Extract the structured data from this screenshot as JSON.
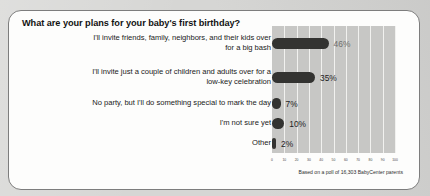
{
  "card": {
    "title": "What are your plans for your baby's first birthday?",
    "footnote": "Based on a poll of 16,303 BabyCenter parents"
  },
  "chart_data": {
    "type": "bar",
    "orientation": "horizontal",
    "title": "What are your plans for your baby's first birthday?",
    "xlabel": "",
    "ylabel": "",
    "xlim": [
      0,
      100
    ],
    "grid": true,
    "legend": false,
    "categories": [
      "I'll invite friends, family, neighbors, and their kids over for a big bash",
      "I'll invite just a couple of children and adults over for a low-key celebration",
      "No party, but I'll do something special to mark the day",
      "I'm not sure yet",
      "Other"
    ],
    "values": [
      46,
      35,
      7,
      10,
      2
    ],
    "value_labels": [
      "46%",
      "35%",
      "7%",
      "10%",
      "2%"
    ],
    "xticks": [
      0,
      10,
      20,
      30,
      40,
      50,
      60,
      70,
      80,
      90,
      100
    ],
    "xtick_labels": [
      "0",
      "10",
      "20",
      "30",
      "40",
      "50",
      "60",
      "70",
      "80",
      "90",
      "100"
    ],
    "bar_color": "#333331",
    "plot_background": "#c7c7c5",
    "gridline_color": "#f1f1ef",
    "annotation": "Based on a poll of 16,303 BabyCenter parents",
    "rows": [
      {
        "label_line1": "I'll invite friends, family, neighbors, and their kids over",
        "label_line2": "for a big bash",
        "value": 46,
        "value_label": "46%"
      },
      {
        "label_line1": "I'll invite just a couple of children and adults over for a",
        "label_line2": "low-key celebration",
        "value": 35,
        "value_label": "35%"
      },
      {
        "label_line1": "No party, but I'll do something special to mark the day",
        "label_line2": "",
        "value": 7,
        "value_label": "7%"
      },
      {
        "label_line1": "I'm not sure yet",
        "label_line2": "",
        "value": 10,
        "value_label": "10%"
      },
      {
        "label_line1": "Other",
        "label_line2": "",
        "value": 2,
        "value_label": "2%"
      }
    ]
  }
}
